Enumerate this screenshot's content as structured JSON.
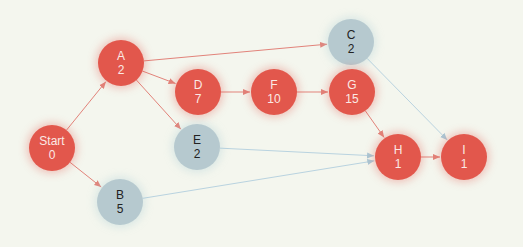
{
  "colors": {
    "critical": "#e2574c",
    "normal": "#b6c9cf",
    "critical_edge": "#e2837a",
    "normal_edge": "#b9d3e0",
    "background": "#f4f6ee"
  },
  "nodes": [
    {
      "id": "start",
      "label": "Start",
      "value": "0",
      "x": 52,
      "y": 148,
      "type": "critical"
    },
    {
      "id": "A",
      "label": "A",
      "value": "2",
      "x": 121,
      "y": 63,
      "type": "critical"
    },
    {
      "id": "B",
      "label": "B",
      "value": "5",
      "x": 120,
      "y": 202,
      "type": "normal"
    },
    {
      "id": "C",
      "label": "C",
      "value": "2",
      "x": 351,
      "y": 42,
      "type": "normal"
    },
    {
      "id": "D",
      "label": "D",
      "value": "7",
      "x": 198,
      "y": 92,
      "type": "critical"
    },
    {
      "id": "E",
      "label": "E",
      "value": "2",
      "x": 197,
      "y": 147,
      "type": "normal"
    },
    {
      "id": "F",
      "label": "F",
      "value": "10",
      "x": 274,
      "y": 92,
      "type": "critical"
    },
    {
      "id": "G",
      "label": "G",
      "value": "15",
      "x": 352,
      "y": 92,
      "type": "critical"
    },
    {
      "id": "H",
      "label": "H",
      "value": "1",
      "x": 398,
      "y": 157,
      "type": "critical"
    },
    {
      "id": "I",
      "label": "I",
      "value": "1",
      "x": 464,
      "y": 157,
      "type": "critical"
    }
  ],
  "edges": [
    {
      "from": "start",
      "to": "A",
      "type": "critical"
    },
    {
      "from": "start",
      "to": "B",
      "type": "critical"
    },
    {
      "from": "A",
      "to": "C",
      "type": "critical"
    },
    {
      "from": "A",
      "to": "D",
      "type": "critical"
    },
    {
      "from": "A",
      "to": "E",
      "type": "critical"
    },
    {
      "from": "D",
      "to": "F",
      "type": "critical"
    },
    {
      "from": "F",
      "to": "G",
      "type": "critical"
    },
    {
      "from": "G",
      "to": "H",
      "type": "critical"
    },
    {
      "from": "E",
      "to": "H",
      "type": "normal"
    },
    {
      "from": "B",
      "to": "H",
      "type": "normal"
    },
    {
      "from": "C",
      "to": "I",
      "type": "normal"
    },
    {
      "from": "H",
      "to": "I",
      "type": "critical"
    }
  ]
}
